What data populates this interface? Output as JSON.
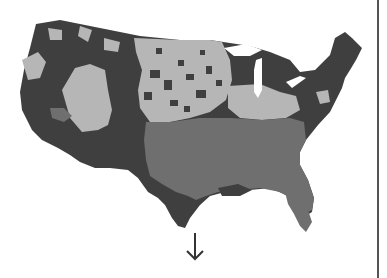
{
  "map": {
    "subject": "United States counties choropleth",
    "colors": {
      "dark": "#3f3f3f",
      "medium": "#6f6f6f",
      "light": "#b6b6b6",
      "background": "#ffffff",
      "divider": "#555555"
    },
    "regions": [
      {
        "name": "pacific-west",
        "shade": "dark"
      },
      {
        "name": "great-basin",
        "shade": "light"
      },
      {
        "name": "northern-rockies",
        "shade": "dark"
      },
      {
        "name": "great-plains",
        "shade": "light"
      },
      {
        "name": "upper-midwest",
        "shade": "dark"
      },
      {
        "name": "northeast",
        "shade": "dark"
      },
      {
        "name": "southeast",
        "shade": "medium"
      },
      {
        "name": "southwest",
        "shade": "dark"
      }
    ]
  },
  "indicators": {
    "arrow": "down-arrow-icon"
  }
}
